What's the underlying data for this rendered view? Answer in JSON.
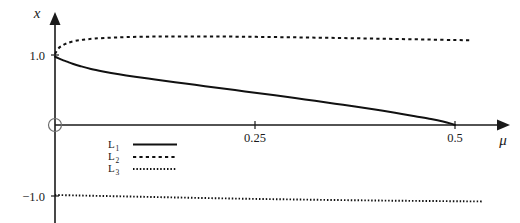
{
  "chart_data": {
    "type": "line",
    "title": "",
    "subtitle": "",
    "xlabel": "μ",
    "ylabel": "x",
    "xlim": [
      0,
      0.555
    ],
    "ylim": [
      -1.18,
      1.42
    ],
    "grid": false,
    "legend_position": "inside-lower-left",
    "x_ticks": [
      {
        "value": 0.25,
        "label": "0.25"
      },
      {
        "value": 0.5,
        "label": "0.5"
      }
    ],
    "y_ticks": [
      {
        "value": 1.0,
        "label": "1.0"
      },
      {
        "value": -1.0,
        "label": "−1.0"
      }
    ],
    "origin_marker": "open-circle",
    "series": [
      {
        "name": "L₁",
        "legend_label": "L",
        "legend_sub": "1",
        "style": "solid",
        "color": "#111111",
        "x": [
          0.0,
          0.004,
          0.009,
          0.015,
          0.022,
          0.032,
          0.045,
          0.06,
          0.08,
          0.1,
          0.125,
          0.15,
          0.175,
          0.2,
          0.225,
          0.25,
          0.275,
          0.3,
          0.325,
          0.35,
          0.375,
          0.4,
          0.425,
          0.45,
          0.47,
          0.485,
          0.495,
          0.5
        ],
        "y": [
          0.975,
          0.955,
          0.93,
          0.905,
          0.875,
          0.84,
          0.8,
          0.765,
          0.725,
          0.69,
          0.65,
          0.61,
          0.575,
          0.535,
          0.5,
          0.46,
          0.425,
          0.385,
          0.345,
          0.305,
          0.265,
          0.22,
          0.175,
          0.125,
          0.085,
          0.05,
          0.02,
          0.0
        ]
      },
      {
        "name": "L₂",
        "legend_label": "L",
        "legend_sub": "2",
        "style": "dashed",
        "color": "#111111",
        "x": [
          0.0,
          0.004,
          0.009,
          0.015,
          0.024,
          0.035,
          0.05,
          0.07,
          0.09,
          0.115,
          0.14,
          0.17,
          0.2,
          0.23,
          0.26,
          0.29,
          0.32,
          0.35,
          0.38,
          0.41,
          0.44,
          0.47,
          0.5,
          0.52
        ],
        "y": [
          1.015,
          1.09,
          1.135,
          1.168,
          1.198,
          1.218,
          1.235,
          1.248,
          1.256,
          1.262,
          1.265,
          1.266,
          1.265,
          1.262,
          1.258,
          1.254,
          1.249,
          1.244,
          1.238,
          1.232,
          1.226,
          1.22,
          1.214,
          1.21
        ]
      },
      {
        "name": "L₃",
        "legend_label": "L",
        "legend_sub": "3",
        "style": "dotted",
        "color": "#111111",
        "x": [
          0.0,
          0.03,
          0.06,
          0.09,
          0.12,
          0.15,
          0.18,
          0.21,
          0.24,
          0.27,
          0.3,
          0.33,
          0.36,
          0.39,
          0.42,
          0.45,
          0.48,
          0.51,
          0.535
        ],
        "y": [
          -1.0,
          -1.007,
          -1.014,
          -1.021,
          -1.028,
          -1.035,
          -1.042,
          -1.048,
          -1.054,
          -1.059,
          -1.064,
          -1.069,
          -1.073,
          -1.077,
          -1.081,
          -1.084,
          -1.087,
          -1.09,
          -1.092
        ]
      }
    ],
    "legend": [
      {
        "label": "L",
        "sub": "1",
        "style": "solid"
      },
      {
        "label": "L",
        "sub": "2",
        "style": "dashed"
      },
      {
        "label": "L",
        "sub": "3",
        "style": "dotted"
      }
    ]
  }
}
